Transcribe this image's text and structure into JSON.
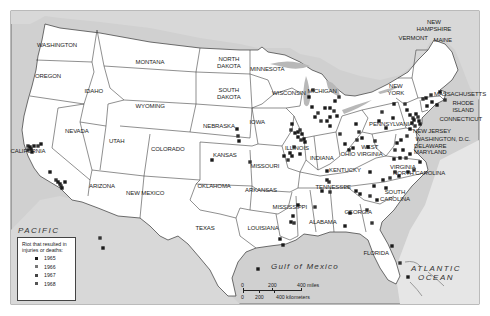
{
  "map": {
    "states": [
      {
        "name": "WASHINGTON",
        "x": 57,
        "y": 45
      },
      {
        "name": "OREGON",
        "x": 48,
        "y": 76
      },
      {
        "name": "IDAHO",
        "x": 94,
        "y": 91
      },
      {
        "name": "MONTANA",
        "x": 150,
        "y": 62
      },
      {
        "name": "WYOMING",
        "x": 150,
        "y": 106
      },
      {
        "name": "NORTH\nDAKOTA",
        "x": 229,
        "y": 62
      },
      {
        "name": "SOUTH\nDAKOTA",
        "x": 229,
        "y": 93
      },
      {
        "name": "MINNESOTA",
        "x": 267,
        "y": 69
      },
      {
        "name": "WISCONSIN",
        "x": 289,
        "y": 93
      },
      {
        "name": "MICHIGAN",
        "x": 322,
        "y": 91
      },
      {
        "name": "NEVADA",
        "x": 77,
        "y": 131
      },
      {
        "name": "UTAH",
        "x": 117,
        "y": 141
      },
      {
        "name": "COLORADO",
        "x": 168,
        "y": 149
      },
      {
        "name": "NEBRASKA",
        "x": 219,
        "y": 126
      },
      {
        "name": "IOWA",
        "x": 257,
        "y": 122
      },
      {
        "name": "ILLINOIS",
        "x": 297,
        "y": 148
      },
      {
        "name": "INDIANA",
        "x": 322,
        "y": 158
      },
      {
        "name": "OHIO",
        "x": 348,
        "y": 154
      },
      {
        "name": "PENNSYLVANIA",
        "x": 391,
        "y": 124
      },
      {
        "name": "NEW\nYORK",
        "x": 396,
        "y": 89
      },
      {
        "name": "CALIFORNIA",
        "x": 28,
        "y": 151
      },
      {
        "name": "KANSAS",
        "x": 225,
        "y": 155
      },
      {
        "name": "MISSOURI",
        "x": 265,
        "y": 166
      },
      {
        "name": "KENTUCKY",
        "x": 345,
        "y": 170
      },
      {
        "name": "WEST\nVIRGINIA",
        "x": 370,
        "y": 150
      },
      {
        "name": "VIRGINIA",
        "x": 403,
        "y": 167
      },
      {
        "name": "ARIZONA",
        "x": 102,
        "y": 186
      },
      {
        "name": "NEW MEXICO",
        "x": 145,
        "y": 193
      },
      {
        "name": "OKLAHOMA",
        "x": 214,
        "y": 186
      },
      {
        "name": "ARKANSAS",
        "x": 261,
        "y": 190
      },
      {
        "name": "TENNESSEE",
        "x": 333,
        "y": 187
      },
      {
        "name": "NORTH CAROLINA",
        "x": 419,
        "y": 173
      },
      {
        "name": "SOUTH\nCAROLINA",
        "x": 395,
        "y": 195
      },
      {
        "name": "MISSISSIPPI",
        "x": 290,
        "y": 207
      },
      {
        "name": "ALABAMA",
        "x": 323,
        "y": 222
      },
      {
        "name": "GEORGIA",
        "x": 358,
        "y": 212
      },
      {
        "name": "TEXAS",
        "x": 205,
        "y": 228
      },
      {
        "name": "LOUISIANA",
        "x": 263,
        "y": 228
      },
      {
        "name": "FLORIDA",
        "x": 376,
        "y": 253
      },
      {
        "name": "NEW\nHAMPSHIRE",
        "x": 434,
        "y": 25
      },
      {
        "name": "VERMONT",
        "x": 413,
        "y": 38
      },
      {
        "name": "MAINE",
        "x": 443,
        "y": 40
      },
      {
        "name": "MASSACHUSETTS",
        "x": 460,
        "y": 94
      },
      {
        "name": "RHODE\nISLAND",
        "x": 463,
        "y": 106
      },
      {
        "name": "CONNECTICUT",
        "x": 461,
        "y": 119
      },
      {
        "name": "NEW JERSEY",
        "x": 432,
        "y": 131
      },
      {
        "name": "WASHINGTON, D.C.",
        "x": 443,
        "y": 139
      },
      {
        "name": "DELAWARE",
        "x": 430,
        "y": 146
      },
      {
        "name": "MARYLAND",
        "x": 430,
        "y": 152
      }
    ],
    "oceans": {
      "pacific": "PACIFIC\nOCEAN",
      "atlantic": "ATLANTIC\nOCEAN",
      "gulf": "Gulf of Mexico"
    },
    "colors": {
      "water": "#c9c9c9",
      "land": "#ffffff",
      "foreign_land": "#d6d6d6",
      "border": "#3a3a3a",
      "marker_1965": "#1a1a1a",
      "marker_1966": "#777777",
      "marker_1967": "#444444",
      "marker_1968": "#555555"
    },
    "legend": {
      "title": "Riot that resulted in injuries or deaths:",
      "items": [
        {
          "year": "1965",
          "color": "#1a1a1a"
        },
        {
          "year": "1966",
          "color": "#777777"
        },
        {
          "year": "1967",
          "color": "#444444"
        },
        {
          "year": "1968",
          "color": "#555555"
        }
      ]
    },
    "scale": {
      "miles": [
        "0",
        "200",
        "400 miles"
      ],
      "km": [
        "0",
        "200",
        "400 kilometers"
      ]
    },
    "markers": [
      [
        28,
        146
      ],
      [
        30,
        147
      ],
      [
        31,
        149
      ],
      [
        28,
        150
      ],
      [
        32,
        152
      ],
      [
        34,
        146
      ],
      [
        38,
        146
      ],
      [
        41,
        144
      ],
      [
        50,
        172
      ],
      [
        56,
        180
      ],
      [
        58,
        182
      ],
      [
        60,
        184
      ],
      [
        61,
        186
      ],
      [
        62,
        188
      ],
      [
        65,
        182
      ],
      [
        100,
        238
      ],
      [
        103,
        248
      ],
      [
        237,
        129
      ],
      [
        238,
        136
      ],
      [
        239,
        141
      ],
      [
        212,
        160
      ],
      [
        250,
        162
      ],
      [
        290,
        153
      ],
      [
        292,
        156
      ],
      [
        288,
        160
      ],
      [
        284,
        156
      ],
      [
        292,
        124
      ],
      [
        291,
        130
      ],
      [
        295,
        133
      ],
      [
        298,
        132
      ],
      [
        300,
        130
      ],
      [
        302,
        134
      ],
      [
        298,
        137
      ],
      [
        301,
        140
      ],
      [
        304,
        139
      ],
      [
        305,
        142
      ],
      [
        294,
        147
      ],
      [
        300,
        154
      ],
      [
        312,
        107
      ],
      [
        318,
        113
      ],
      [
        325,
        108
      ],
      [
        330,
        108
      ],
      [
        334,
        111
      ],
      [
        330,
        117
      ],
      [
        327,
        121
      ],
      [
        321,
        121
      ],
      [
        315,
        117
      ],
      [
        335,
        101
      ],
      [
        339,
        97
      ],
      [
        337,
        116
      ],
      [
        330,
        126
      ],
      [
        340,
        134
      ],
      [
        345,
        144
      ],
      [
        349,
        150
      ],
      [
        357,
        140
      ],
      [
        362,
        138
      ],
      [
        356,
        124
      ],
      [
        359,
        132
      ],
      [
        353,
        148
      ],
      [
        368,
        147
      ],
      [
        375,
        141
      ],
      [
        386,
        128
      ],
      [
        379,
        121
      ],
      [
        382,
        112
      ],
      [
        393,
        118
      ],
      [
        394,
        104
      ],
      [
        405,
        104
      ],
      [
        407,
        110
      ],
      [
        410,
        115
      ],
      [
        413,
        118
      ],
      [
        414,
        120
      ],
      [
        416,
        114
      ],
      [
        418,
        117
      ],
      [
        419,
        121
      ],
      [
        412,
        123
      ],
      [
        415,
        126
      ],
      [
        420,
        124
      ],
      [
        410,
        129
      ],
      [
        407,
        136
      ],
      [
        401,
        140
      ],
      [
        397,
        143
      ],
      [
        395,
        150
      ],
      [
        400,
        158
      ],
      [
        403,
        150
      ],
      [
        406,
        158
      ],
      [
        410,
        154
      ],
      [
        420,
        162
      ],
      [
        414,
        170
      ],
      [
        408,
        172
      ],
      [
        426,
        98
      ],
      [
        431,
        95
      ],
      [
        432,
        102
      ],
      [
        437,
        105
      ],
      [
        445,
        100
      ],
      [
        440,
        92
      ],
      [
        427,
        106
      ],
      [
        423,
        99
      ],
      [
        370,
        172
      ],
      [
        383,
        180
      ],
      [
        390,
        178
      ],
      [
        386,
        188
      ],
      [
        374,
        186
      ],
      [
        370,
        196
      ],
      [
        377,
        200
      ],
      [
        399,
        176
      ],
      [
        395,
        172
      ],
      [
        394,
        159
      ],
      [
        327,
        180
      ],
      [
        329,
        182
      ],
      [
        327,
        171
      ],
      [
        322,
        191
      ],
      [
        330,
        192
      ],
      [
        356,
        191
      ],
      [
        360,
        194
      ],
      [
        367,
        210
      ],
      [
        350,
        213
      ],
      [
        345,
        226
      ],
      [
        372,
        223
      ],
      [
        392,
        246
      ],
      [
        408,
        277
      ],
      [
        400,
        263
      ],
      [
        293,
        216
      ],
      [
        291,
        222
      ],
      [
        294,
        223
      ],
      [
        280,
        239
      ],
      [
        283,
        245
      ],
      [
        315,
        207
      ],
      [
        298,
        205
      ],
      [
        258,
        269
      ],
      [
        313,
        90
      ],
      [
        309,
        97
      ]
    ]
  }
}
